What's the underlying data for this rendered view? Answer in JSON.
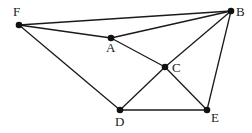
{
  "diagram": {
    "points": [
      {
        "id": "F",
        "label": "F",
        "x": 19,
        "y": 25,
        "lx": 13,
        "ly": 16
      },
      {
        "id": "B",
        "label": "B",
        "x": 231,
        "y": 11,
        "lx": 236,
        "ly": 16
      },
      {
        "id": "A",
        "label": "A",
        "x": 111,
        "y": 38,
        "lx": 106,
        "ly": 52
      },
      {
        "id": "C",
        "label": "C",
        "x": 165,
        "y": 67,
        "lx": 172,
        "ly": 72
      },
      {
        "id": "D",
        "label": "D",
        "x": 120,
        "y": 110,
        "lx": 115,
        "ly": 126
      },
      {
        "id": "E",
        "label": "E",
        "x": 207,
        "y": 110,
        "lx": 211,
        "ly": 122
      }
    ],
    "edges": [
      [
        "F",
        "B"
      ],
      [
        "F",
        "A"
      ],
      [
        "A",
        "B"
      ],
      [
        "B",
        "C"
      ],
      [
        "A",
        "C"
      ],
      [
        "C",
        "E"
      ],
      [
        "C",
        "D"
      ],
      [
        "D",
        "E"
      ],
      [
        "F",
        "D"
      ],
      [
        "B",
        "E"
      ]
    ]
  }
}
